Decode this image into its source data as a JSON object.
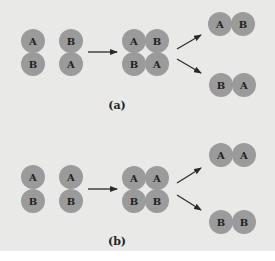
{
  "figure": {
    "background_color": "#e9e9e8",
    "atom_color": "#9b9b9b",
    "text_color": "#222222",
    "arrow_color": "#2a2a2a",
    "panels": [
      {
        "label": "(a)",
        "reactants": [
          {
            "top": "A",
            "bottom": "B"
          },
          {
            "top": "B",
            "bottom": "A"
          }
        ],
        "intermediate": {
          "top_left": "A",
          "top_right": "B",
          "bottom_left": "B",
          "bottom_right": "A"
        },
        "products": [
          {
            "left": "A",
            "right": "B"
          },
          {
            "left": "B",
            "right": "A"
          }
        ]
      },
      {
        "label": "(b)",
        "reactants": [
          {
            "top": "A",
            "bottom": "B"
          },
          {
            "top": "A",
            "bottom": "B"
          }
        ],
        "intermediate": {
          "top_left": "A",
          "top_right": "A",
          "bottom_left": "B",
          "bottom_right": "B"
        },
        "products": [
          {
            "left": "A",
            "right": "A"
          },
          {
            "left": "B",
            "right": "B"
          }
        ]
      }
    ]
  }
}
